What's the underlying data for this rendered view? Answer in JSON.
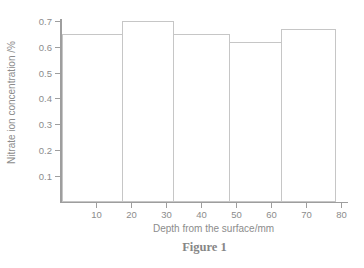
{
  "figure": {
    "caption": "Figure 1"
  },
  "chart_data": {
    "type": "bar",
    "title": "",
    "xlabel": "Depth from the surface/mm",
    "ylabel": "Nitrate ion concentration /%",
    "x_ticks_mm": [
      10,
      20,
      30,
      40,
      50,
      60,
      70,
      80
    ],
    "x_tick_labels": [
      "10",
      "20",
      "30",
      "40",
      "50",
      "60",
      "70",
      "80"
    ],
    "y_ticks": [
      0.1,
      0.2,
      0.3,
      0.4,
      0.5,
      0.6,
      0.7
    ],
    "y_tick_labels": [
      "0.1",
      "0.2",
      "0.3",
      "0.4",
      "0.5",
      "0.6",
      "0.7"
    ],
    "xlim": [
      0,
      82
    ],
    "ylim": [
      0,
      0.72
    ],
    "grid": false,
    "bars": [
      {
        "from_mm": 0,
        "to_mm": 17.5,
        "value": 0.65
      },
      {
        "from_mm": 17.5,
        "to_mm": 32,
        "value": 0.7
      },
      {
        "from_mm": 32,
        "to_mm": 48,
        "value": 0.65
      },
      {
        "from_mm": 48,
        "to_mm": 63,
        "value": 0.62
      },
      {
        "from_mm": 63,
        "to_mm": 78.5,
        "value": 0.67
      }
    ],
    "colors": {
      "background": "#ffffff",
      "axis": "#9e9e9e",
      "text": "#8c8c8c",
      "bar_fill": "#ffffff",
      "bar_border": "#c6c6c6",
      "caption_text": "#868686"
    }
  }
}
